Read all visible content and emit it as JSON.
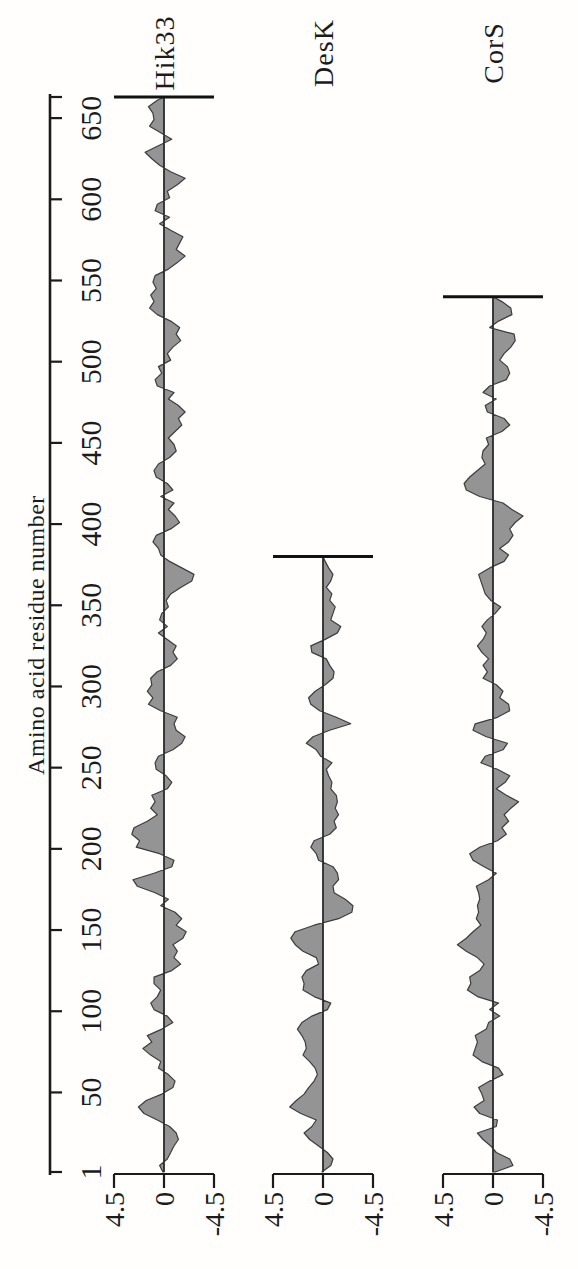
{
  "figure_title": "Hydropathy profiles of Hik33, DesK and CorS",
  "chart_data": {
    "type": "area",
    "xlabel": "Amino acid residue number",
    "xlim": [
      1,
      663
    ],
    "x_tick_labels": [
      1,
      50,
      100,
      150,
      200,
      250,
      300,
      350,
      400,
      450,
      500,
      550,
      600,
      650
    ],
    "x_axis_terminal": 663,
    "ylim": [
      -4.5,
      4.5
    ],
    "y_tick_labels": [
      "4.5",
      "0",
      "-4.5"
    ],
    "grid": false,
    "orientation": "figure rotated 90 degrees counterclockwise",
    "legend_position": "right of each trace",
    "colors": {
      "fill": "#949494",
      "stroke": "#3d3d3d",
      "axis": "#1b1b1b",
      "baseline": "#2b2b2b",
      "endbar": "#111111"
    },
    "series": [
      {
        "name": "Hik33",
        "start": 1,
        "step": 4,
        "end": 663,
        "values": [
          0.1,
          0.4,
          -0.3,
          -0.6,
          -0.9,
          -1.3,
          -1.1,
          -0.5,
          0.6,
          1.8,
          2.3,
          1.6,
          0.2,
          -0.8,
          -1.0,
          -0.4,
          0.5,
          0.3,
          1.2,
          1.9,
          1.1,
          1.5,
          0.2,
          -0.8,
          -0.3,
          0.9,
          1.2,
          0.6,
          0.3,
          0.9,
          0.9,
          -0.7,
          -1.5,
          -0.9,
          -1.2,
          -0.8,
          -1.7,
          -2.0,
          -1.1,
          -1.6,
          -1.0,
          0.3,
          -0.4,
          0.8,
          2.4,
          2.8,
          0.9,
          -0.7,
          -0.9,
          0.4,
          2.5,
          2.2,
          2.9,
          2.7,
          1.5,
          0.6,
          1.2,
          0.8,
          1.1,
          -0.3,
          -0.7,
          -0.2,
          0.7,
          0.8,
          0.5,
          -0.8,
          -1.6,
          -1.9,
          -1.1,
          -0.9,
          -1.2,
          0.3,
          1.4,
          1.0,
          1.5,
          1.1,
          1.2,
          0.6,
          -0.6,
          -1.2,
          -0.8,
          -1.1,
          -0.3,
          0.5,
          -0.3,
          0.4,
          0.2,
          -0.4,
          -0.2,
          -0.6,
          -1.5,
          -2.5,
          -2.7,
          -1.6,
          -0.5,
          0.3,
          0.5,
          1.0,
          0.7,
          -0.6,
          -1.4,
          -1.0,
          -0.4,
          -0.9,
          0.3,
          -0.8,
          -0.3,
          0.7,
          0.9,
          0.5,
          -0.5,
          -1.1,
          -0.9,
          -0.4,
          -1.0,
          -1.6,
          -1.3,
          -1.9,
          -1.3,
          -0.4,
          -0.9,
          0.6,
          0.8,
          0.2,
          0.5,
          -0.6,
          -0.3,
          -0.8,
          -1.5,
          -1.1,
          -1.4,
          -0.6,
          0.6,
          1.3,
          0.9,
          1.2,
          0.7,
          1.0,
          0.8,
          -0.4,
          -1.2,
          -1.9,
          -1.1,
          -1.4,
          -1.7,
          -0.6,
          0.4,
          -0.5,
          0.8,
          0.6,
          -0.5,
          -0.3,
          -1.2,
          -1.9,
          -0.6,
          0.4,
          1.1,
          1.7,
          0.5,
          -0.7,
          0.3,
          1.3,
          0.9,
          1.0,
          1.4,
          0.6
        ]
      },
      {
        "name": "DesK",
        "start": 1,
        "step": 4,
        "end": 380,
        "values": [
          0.1,
          -0.7,
          -0.9,
          -0.4,
          0.4,
          1.2,
          1.7,
          1.0,
          0.6,
          2.0,
          3.0,
          2.4,
          1.7,
          1.3,
          0.8,
          0.5,
          0.7,
          1.2,
          1.8,
          1.5,
          1.6,
          1.9,
          2.3,
          1.9,
          1.0,
          -0.4,
          -0.7,
          0.8,
          1.8,
          1.7,
          1.9,
          1.5,
          0.4,
          0.6,
          1.8,
          2.5,
          2.9,
          2.5,
          0.8,
          -1.4,
          -2.6,
          -2.7,
          -2.0,
          -1.0,
          -0.9,
          -1.4,
          -1.3,
          -0.9,
          0.4,
          0.6,
          1.1,
          0.8,
          -0.6,
          -1.2,
          -1.0,
          -1.4,
          -1.1,
          -1.3,
          -1.2,
          -0.7,
          -0.8,
          -0.5,
          -0.3,
          -0.8,
          0.2,
          0.6,
          1.5,
          0.9,
          -0.6,
          -2.5,
          -1.2,
          0.3,
          1.1,
          1.3,
          0.7,
          -0.2,
          -0.9,
          -1.0,
          -0.6,
          -0.3,
          1.0,
          1.1,
          -0.2,
          -1.3,
          -1.6,
          -0.7,
          -0.9,
          -1.1,
          -0.6,
          -0.8,
          -0.3,
          -0.7,
          -0.9,
          -0.5,
          -0.2
        ]
      },
      {
        "name": "CorS",
        "start": 1,
        "step": 4,
        "end": 540,
        "values": [
          -0.2,
          -1.8,
          -1.5,
          -0.3,
          0.2,
          0.9,
          1.4,
          -0.3,
          -0.4,
          1.2,
          1.7,
          0.8,
          1.0,
          1.3,
          0.3,
          -0.9,
          -0.5,
          1.0,
          1.8,
          1.6,
          1.4,
          1.6,
          0.6,
          0.4,
          -0.6,
          0.3,
          -0.5,
          1.4,
          2.3,
          2.0,
          2.1,
          1.2,
          0.8,
          1.4,
          2.4,
          3.2,
          2.4,
          1.8,
          1.1,
          1.5,
          1.3,
          1.4,
          1.2,
          1.3,
          1.5,
          0.4,
          -0.3,
          0.8,
          1.8,
          2.1,
          1.2,
          -0.4,
          -1.2,
          -0.8,
          -1.4,
          -1.0,
          -1.6,
          -2.3,
          -1.2,
          -0.3,
          -1.1,
          -1.5,
          -0.4,
          1.1,
          0.7,
          -0.9,
          -1.3,
          0.6,
          1.8,
          1.6,
          -0.4,
          -1.5,
          -1.4,
          -0.6,
          -0.9,
          -0.3,
          0.9,
          0.5,
          0.9,
          0.4,
          1.0,
          1.4,
          0.9,
          0.6,
          1.0,
          0.5,
          -0.2,
          -0.7,
          0.2,
          0.7,
          0.9,
          1.1,
          1.3,
          0.3,
          -1.0,
          -1.4,
          -0.6,
          -1.4,
          -1.8,
          -1.5,
          -2.0,
          -2.7,
          -1.7,
          -0.9,
          1.2,
          2.4,
          2.6,
          2.1,
          1.4,
          0.7,
          1.0,
          0.9,
          0.4,
          0.6,
          -0.8,
          -1.5,
          -1.0,
          0.5,
          0.7,
          -0.3,
          0.9,
          0.3,
          -1.2,
          -1.5,
          -1.3,
          -0.6,
          -1.0,
          -1.6,
          -2.0,
          -1.9,
          0.3,
          -0.5,
          -1.7,
          -1.6,
          -0.8
        ]
      }
    ]
  }
}
